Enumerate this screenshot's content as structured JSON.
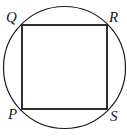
{
  "diagram": {
    "shapes": [
      "circle",
      "square"
    ],
    "vertices": {
      "Q": "Q",
      "R": "R",
      "S": "S",
      "P": "P"
    },
    "colors": {
      "stroke": "#1a1a1a",
      "background": "#ffffff"
    }
  }
}
